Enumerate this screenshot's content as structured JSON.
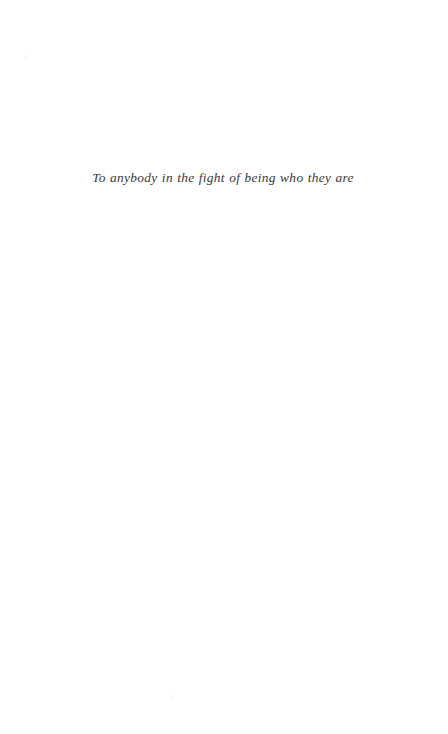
{
  "page": {
    "kind": "book-dedication-page",
    "background_color": "#ffffff",
    "width": 448,
    "height": 734
  },
  "dedication": {
    "text": "To anybody in the fight of being who they are",
    "color": "#2a2a2a",
    "style": "italic-serif"
  },
  "artifacts": {
    "speck_color": "#fafafa"
  }
}
